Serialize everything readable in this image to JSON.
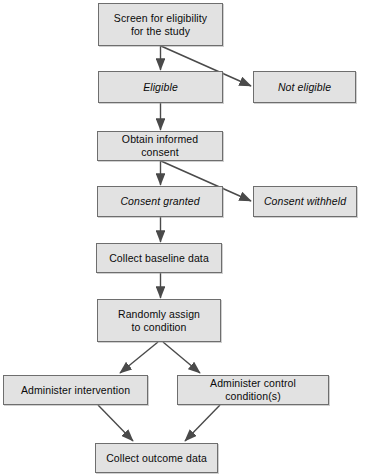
{
  "diagram": {
    "style": {
      "node_fill": "#e2e2e2",
      "node_border": "#6e6e6e",
      "edge_color": "#4a4a4a",
      "text_color": "#0a0a0a",
      "background": "#ffffff"
    },
    "nodes": [
      {
        "id": "screen",
        "label": "Screen for eligibility\nfor the study",
        "italic": false,
        "x": 98,
        "y": 3,
        "w": 125,
        "h": 43
      },
      {
        "id": "eligible",
        "label": "Eligible",
        "italic": true,
        "x": 98,
        "y": 71,
        "w": 125,
        "h": 32
      },
      {
        "id": "not-eligible",
        "label": "Not eligible",
        "italic": true,
        "x": 253,
        "y": 71,
        "w": 103,
        "h": 32
      },
      {
        "id": "obtain-consent",
        "label": "Obtain informed consent",
        "italic": false,
        "x": 97,
        "y": 131,
        "w": 126,
        "h": 30
      },
      {
        "id": "consent-granted",
        "label": "Consent granted",
        "italic": true,
        "x": 97,
        "y": 186,
        "w": 126,
        "h": 31
      },
      {
        "id": "consent-withheld",
        "label": "Consent withheld",
        "italic": true,
        "x": 253,
        "y": 186,
        "w": 104,
        "h": 31
      },
      {
        "id": "baseline",
        "label": "Collect baseline data",
        "italic": false,
        "x": 96,
        "y": 243,
        "w": 126,
        "h": 30
      },
      {
        "id": "randomize",
        "label": "Randomly assign\nto condition",
        "italic": false,
        "x": 97,
        "y": 299,
        "w": 124,
        "h": 43
      },
      {
        "id": "intervention",
        "label": "Administer intervention",
        "italic": false,
        "x": 3,
        "y": 375,
        "w": 145,
        "h": 30
      },
      {
        "id": "control",
        "label": "Administer control condition(s)",
        "italic": false,
        "x": 177,
        "y": 375,
        "w": 152,
        "h": 30
      },
      {
        "id": "outcome",
        "label": "Collect outcome data",
        "italic": false,
        "x": 95,
        "y": 443,
        "w": 123,
        "h": 30
      }
    ],
    "edges": [
      {
        "id": "screen-to-eligible",
        "from": "screen",
        "to": "eligible",
        "kind": "vertical"
      },
      {
        "id": "screen-to-not-eligible",
        "from": "screen",
        "to": "not-eligible",
        "kind": "diagonal"
      },
      {
        "id": "eligible-to-obtain-consent",
        "from": "eligible",
        "to": "obtain-consent",
        "kind": "vertical"
      },
      {
        "id": "obtain-consent-to-consent-granted",
        "from": "obtain-consent",
        "to": "consent-granted",
        "kind": "vertical"
      },
      {
        "id": "obtain-consent-to-consent-withheld",
        "from": "obtain-consent",
        "to": "consent-withheld",
        "kind": "diagonal"
      },
      {
        "id": "consent-granted-to-baseline",
        "from": "consent-granted",
        "to": "baseline",
        "kind": "vertical"
      },
      {
        "id": "baseline-to-randomize",
        "from": "baseline",
        "to": "randomize",
        "kind": "vertical"
      },
      {
        "id": "randomize-to-intervention",
        "from": "randomize",
        "to": "intervention",
        "kind": "diagonal"
      },
      {
        "id": "randomize-to-control",
        "from": "randomize",
        "to": "control",
        "kind": "diagonal"
      },
      {
        "id": "intervention-to-outcome",
        "from": "intervention",
        "to": "outcome",
        "kind": "diagonal"
      },
      {
        "id": "control-to-outcome",
        "from": "control",
        "to": "outcome",
        "kind": "diagonal"
      }
    ]
  }
}
